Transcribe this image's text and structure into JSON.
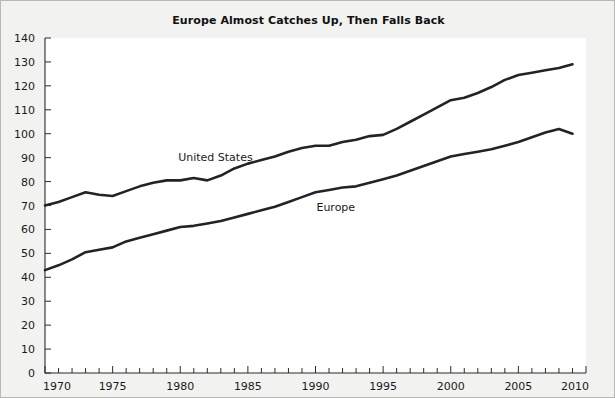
{
  "chart_data": {
    "type": "line",
    "title": "Europe Almost Catches Up, Then Falls Back",
    "xlabel": "",
    "ylabel": "",
    "xlim": [
      1970,
      2010
    ],
    "ylim": [
      0,
      140
    ],
    "grid": false,
    "legend": "inline-labels",
    "y_ticks": [
      0,
      10,
      20,
      30,
      40,
      50,
      60,
      70,
      80,
      90,
      100,
      110,
      120,
      130,
      140
    ],
    "x_ticks_major": [
      1970,
      1975,
      1980,
      1985,
      1990,
      1995,
      2000,
      2005,
      2010
    ],
    "x_minor_tick_interval": 1,
    "x": [
      1970,
      1971,
      1972,
      1973,
      1974,
      1975,
      1976,
      1977,
      1978,
      1979,
      1980,
      1981,
      1982,
      1983,
      1984,
      1985,
      1986,
      1987,
      1988,
      1989,
      1990,
      1991,
      1992,
      1993,
      1994,
      1995,
      1996,
      1997,
      1998,
      1999,
      2000,
      2001,
      2002,
      2003,
      2004,
      2005,
      2006,
      2007,
      2008,
      2009
    ],
    "series": [
      {
        "name": "United States",
        "label_x": 1982.6,
        "label_y": 88.5,
        "values": [
          70,
          71.5,
          73.5,
          75.5,
          74.5,
          74,
          76,
          78,
          79.5,
          80.5,
          80.5,
          81.5,
          80.5,
          82.5,
          85.5,
          87.5,
          89,
          90.5,
          92.5,
          94,
          95,
          95,
          96.5,
          97.5,
          99,
          99.5,
          102,
          105,
          108,
          111,
          114,
          115,
          117,
          119.5,
          122.5,
          124.5,
          125.5,
          126.5,
          127.5,
          129
        ]
      },
      {
        "name": "Europe",
        "label_x": 1991.5,
        "label_y": 67.5,
        "values": [
          43,
          45,
          47.5,
          50.5,
          51.5,
          52.5,
          55,
          56.5,
          58,
          59.5,
          61,
          61.5,
          62.5,
          63.5,
          65,
          66.5,
          68,
          69.5,
          71.5,
          73.5,
          75.5,
          76.5,
          77.5,
          78,
          79.5,
          81,
          82.5,
          84.5,
          86.5,
          88.5,
          90.5,
          91.5,
          92.5,
          93.5,
          95,
          96.5,
          98.5,
          100.5,
          102,
          100
        ]
      }
    ]
  },
  "colors": {
    "line": "#232323",
    "axis": "#2b2b2b",
    "page_background": "#f2f2f0",
    "plot_background": "#ffffff",
    "text": "#1a1a1a"
  }
}
